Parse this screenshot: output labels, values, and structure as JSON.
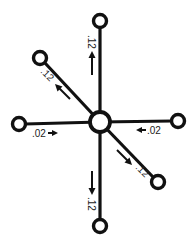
{
  "diagram": {
    "type": "hub-and-spoke flow diagram",
    "center_node": {
      "id": "hub",
      "x": 100,
      "y": 122,
      "r": 10
    },
    "spokes": [
      {
        "id": "top",
        "node": {
          "x": 100,
          "y": 21,
          "r": 6.5
        },
        "value": ".12",
        "flow": "outward"
      },
      {
        "id": "upper-left",
        "node": {
          "x": 40,
          "y": 58,
          "r": 6.5
        },
        "value": ".12",
        "flow": "outward"
      },
      {
        "id": "left",
        "node": {
          "x": 19,
          "y": 124,
          "r": 6.5
        },
        "value": ".02",
        "flow": "inward"
      },
      {
        "id": "right",
        "node": {
          "x": 178,
          "y": 121,
          "r": 6.5
        },
        "value": ".02",
        "flow": "inward"
      },
      {
        "id": "lower-right",
        "node": {
          "x": 158,
          "y": 182,
          "r": 6.5
        },
        "value": ".12",
        "flow": "outward"
      },
      {
        "id": "bottom",
        "node": {
          "x": 100,
          "y": 226,
          "r": 6.5
        },
        "value": ".12",
        "flow": "outward"
      }
    ],
    "labels": {
      "top": ".12",
      "upper_left": ".12",
      "left": ".02",
      "right": ".02",
      "lower_right": ".12",
      "bottom": ".12"
    },
    "colors": {
      "ink": "#111111",
      "background": "#ffffff"
    }
  }
}
